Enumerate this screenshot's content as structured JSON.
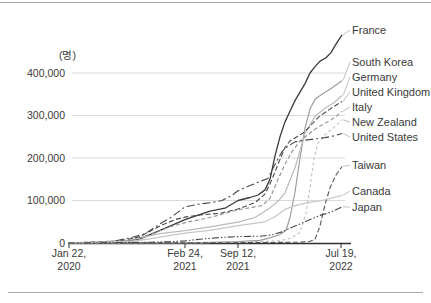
{
  "chart_data": {
    "type": "line",
    "title": "",
    "unit_label": "(명)",
    "legend_position": "right-of-line-ends",
    "grid": true,
    "x_unit": "px (time axis, non-uniform date ticks)",
    "ylim": [
      0,
      500000
    ],
    "y_axis": {
      "ticks": [
        {
          "value": 0,
          "label": "0"
        },
        {
          "value": 100000,
          "label": "100,000"
        },
        {
          "value": 200000,
          "label": "200,000"
        },
        {
          "value": 300000,
          "label": "300,000"
        },
        {
          "value": 400000,
          "label": "400,000"
        }
      ]
    },
    "x_axis": {
      "ticks": [
        {
          "line1": "Jan 22,",
          "line2": "2020",
          "x": 69
        },
        {
          "line1": "Feb 24,",
          "line2": "2021",
          "x": 185
        },
        {
          "line1": "Sep 12,",
          "line2": "2021",
          "x": 238
        },
        {
          "line1": "Jul 19,",
          "line2": "2022",
          "x": 341
        }
      ]
    },
    "series": [
      {
        "name": "France",
        "color": "#3a3a3a",
        "width": 1.3,
        "dash": "",
        "label_y": 30,
        "points": [
          [
            68,
            0
          ],
          [
            100,
            500
          ],
          [
            120,
            2000
          ],
          [
            140,
            10000
          ],
          [
            160,
            30000
          ],
          [
            185,
            55000
          ],
          [
            210,
            75000
          ],
          [
            225,
            82000
          ],
          [
            238,
            100000
          ],
          [
            250,
            107000
          ],
          [
            258,
            113000
          ],
          [
            265,
            125000
          ],
          [
            270,
            150000
          ],
          [
            275,
            205000
          ],
          [
            280,
            250000
          ],
          [
            285,
            285000
          ],
          [
            290,
            310000
          ],
          [
            295,
            335000
          ],
          [
            300,
            355000
          ],
          [
            305,
            375000
          ],
          [
            310,
            400000
          ],
          [
            315,
            415000
          ],
          [
            320,
            428000
          ],
          [
            326,
            436000
          ],
          [
            331,
            448000
          ],
          [
            336,
            468000
          ],
          [
            342,
            490000
          ]
        ]
      },
      {
        "name": "South Korea",
        "color": "#9e9e9e",
        "width": 1.2,
        "dash": "",
        "label_y": 62,
        "points": [
          [
            68,
            0
          ],
          [
            150,
            500
          ],
          [
            200,
            1000
          ],
          [
            238,
            3000
          ],
          [
            260,
            6000
          ],
          [
            270,
            12000
          ],
          [
            280,
            20000
          ],
          [
            286,
            30000
          ],
          [
            290,
            60000
          ],
          [
            295,
            120000
          ],
          [
            300,
            200000
          ],
          [
            305,
            270000
          ],
          [
            310,
            315000
          ],
          [
            315,
            338000
          ],
          [
            322,
            350000
          ],
          [
            330,
            362000
          ],
          [
            342,
            382000
          ]
        ]
      },
      {
        "name": "Germany",
        "color": "#bababa",
        "width": 1.2,
        "dash": "",
        "label_y": 77,
        "points": [
          [
            68,
            0
          ],
          [
            120,
            2000
          ],
          [
            140,
            12000
          ],
          [
            160,
            22000
          ],
          [
            185,
            29000
          ],
          [
            210,
            38000
          ],
          [
            238,
            49000
          ],
          [
            255,
            60000
          ],
          [
            269,
            81000
          ],
          [
            278,
            98000
          ],
          [
            285,
            118000
          ],
          [
            295,
            177000
          ],
          [
            305,
            258000
          ],
          [
            315,
            298000
          ],
          [
            325,
            317000
          ],
          [
            334,
            330000
          ],
          [
            342,
            347000
          ]
        ]
      },
      {
        "name": "United Kingdom",
        "color": "#474747",
        "width": 1.1,
        "dash": "5,2.5",
        "label_y": 92,
        "points": [
          [
            68,
            0
          ],
          [
            120,
            5000
          ],
          [
            140,
            15000
          ],
          [
            160,
            40000
          ],
          [
            175,
            55000
          ],
          [
            185,
            61000
          ],
          [
            200,
            66000
          ],
          [
            220,
            70000
          ],
          [
            238,
            80000
          ],
          [
            255,
            95000
          ],
          [
            265,
            115000
          ],
          [
            272,
            150000
          ],
          [
            278,
            185000
          ],
          [
            285,
            225000
          ],
          [
            290,
            240000
          ],
          [
            297,
            250000
          ],
          [
            305,
            262000
          ],
          [
            312,
            280000
          ],
          [
            318,
            295000
          ],
          [
            325,
            307000
          ],
          [
            333,
            320000
          ],
          [
            342,
            333000
          ]
        ]
      },
      {
        "name": "Italy",
        "color": "#8f8f8f",
        "width": 1.1,
        "dash": "4,2.5",
        "label_y": 107,
        "points": [
          [
            68,
            0
          ],
          [
            130,
            5000
          ],
          [
            150,
            20000
          ],
          [
            170,
            38000
          ],
          [
            185,
            48000
          ],
          [
            210,
            60000
          ],
          [
            238,
            78000
          ],
          [
            262,
            88000
          ],
          [
            270,
            105000
          ],
          [
            278,
            150000
          ],
          [
            285,
            185000
          ],
          [
            292,
            215000
          ],
          [
            300,
            240000
          ],
          [
            308,
            255000
          ],
          [
            315,
            268000
          ],
          [
            322,
            278000
          ],
          [
            330,
            288000
          ],
          [
            336,
            298000
          ],
          [
            342,
            310000
          ]
        ]
      },
      {
        "name": "New Zealand",
        "color": "#c0c0c0",
        "width": 1.1,
        "dash": "3,2.5",
        "label_y": 122,
        "points": [
          [
            68,
            200
          ],
          [
            200,
            800
          ],
          [
            238,
            2000
          ],
          [
            280,
            5000
          ],
          [
            292,
            12000
          ],
          [
            300,
            25000
          ],
          [
            306,
            70000
          ],
          [
            310,
            130000
          ],
          [
            314,
            200000
          ],
          [
            318,
            235000
          ],
          [
            325,
            255000
          ],
          [
            334,
            272000
          ],
          [
            342,
            290000
          ]
        ]
      },
      {
        "name": "United States",
        "color": "#474747",
        "width": 1.1,
        "dash": "8,3,2,3",
        "label_y": 137,
        "points": [
          [
            68,
            0
          ],
          [
            100,
            1000
          ],
          [
            115,
            5000
          ],
          [
            130,
            12000
          ],
          [
            145,
            22000
          ],
          [
            160,
            45000
          ],
          [
            172,
            62000
          ],
          [
            185,
            85000
          ],
          [
            200,
            92000
          ],
          [
            212,
            95000
          ],
          [
            222,
            100000
          ],
          [
            232,
            112000
          ],
          [
            238,
            123000
          ],
          [
            250,
            135000
          ],
          [
            260,
            145000
          ],
          [
            268,
            152000
          ],
          [
            275,
            185000
          ],
          [
            282,
            215000
          ],
          [
            288,
            228000
          ],
          [
            295,
            238000
          ],
          [
            305,
            242000
          ],
          [
            315,
            245000
          ],
          [
            325,
            248000
          ],
          [
            334,
            252000
          ],
          [
            342,
            258000
          ]
        ]
      },
      {
        "name": "Taiwan",
        "color": "#555555",
        "width": 1.1,
        "dash": "5,2.5",
        "label_y": 165,
        "points": [
          [
            68,
            0
          ],
          [
            200,
            500
          ],
          [
            260,
            1000
          ],
          [
            300,
            2000
          ],
          [
            310,
            4000
          ],
          [
            315,
            8000
          ],
          [
            320,
            40000
          ],
          [
            325,
            90000
          ],
          [
            330,
            130000
          ],
          [
            336,
            160000
          ],
          [
            342,
            180000
          ]
        ]
      },
      {
        "name": "Canada",
        "color": "#c6c6c6",
        "width": 1.2,
        "dash": "",
        "label_y": 191,
        "points": [
          [
            68,
            0
          ],
          [
            130,
            4000
          ],
          [
            150,
            10000
          ],
          [
            170,
            18000
          ],
          [
            185,
            23000
          ],
          [
            210,
            30000
          ],
          [
            238,
            41000
          ],
          [
            265,
            50000
          ],
          [
            275,
            62000
          ],
          [
            285,
            79000
          ],
          [
            295,
            88000
          ],
          [
            308,
            95000
          ],
          [
            322,
            100000
          ],
          [
            342,
            112000
          ]
        ]
      },
      {
        "name": "Japan",
        "color": "#474747",
        "width": 1.1,
        "dash": "7,2,1.5,2,1.5,2",
        "label_y": 207,
        "points": [
          [
            68,
            0
          ],
          [
            150,
            2000
          ],
          [
            170,
            3000
          ],
          [
            185,
            5000
          ],
          [
            200,
            9000
          ],
          [
            220,
            13000
          ],
          [
            238,
            15000
          ],
          [
            260,
            16000
          ],
          [
            272,
            19000
          ],
          [
            282,
            26000
          ],
          [
            290,
            35000
          ],
          [
            300,
            45000
          ],
          [
            310,
            55000
          ],
          [
            320,
            65000
          ],
          [
            330,
            72000
          ],
          [
            342,
            85000
          ]
        ]
      }
    ],
    "layout": {
      "axis_y0_px": 243,
      "px_per_100k": 42.5,
      "plot_left_px": 68,
      "plot_right_px": 345,
      "grid_right_px": 345,
      "label_x_px": 352,
      "grid_color": "#dadada",
      "axis_color": "#2f2f2f",
      "leader_color": "#b0b0b0",
      "text_color": "#3a3a3a"
    }
  }
}
